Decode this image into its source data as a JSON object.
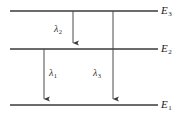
{
  "diagram": {
    "type": "energy-level-diagram",
    "title": "",
    "background_color": "#ffffff",
    "line_color": "#3a3a3a",
    "arrow_color": "#4a4a4a",
    "text_color": "#1a1a1a",
    "levels": [
      {
        "id": "E3",
        "symbol": "E",
        "subscript": "3",
        "y": 11,
        "x_start": 10,
        "x_end": 158,
        "label_x": 161,
        "label_y": 5
      },
      {
        "id": "E2",
        "symbol": "E",
        "subscript": "2",
        "y": 49,
        "x_start": 10,
        "x_end": 158,
        "label_x": 161,
        "label_y": 43
      },
      {
        "id": "E1",
        "symbol": "E",
        "subscript": "1",
        "y": 105,
        "x_start": 10,
        "x_end": 158,
        "label_x": 161,
        "label_y": 99
      }
    ],
    "transitions": [
      {
        "id": "lambda2",
        "symbol": "λ",
        "subscript": "2",
        "from_level": "E3",
        "to_level": "E2",
        "x": 73,
        "y_start": 11,
        "y_end": 49,
        "label_x": 54,
        "label_y": 24,
        "direction": "down"
      },
      {
        "id": "lambda1",
        "symbol": "λ",
        "subscript": "1",
        "from_level": "E2",
        "to_level": "E1",
        "x": 44,
        "y_start": 49,
        "y_end": 105,
        "label_x": 49,
        "label_y": 68,
        "direction": "down"
      },
      {
        "id": "lambda3",
        "symbol": "λ",
        "subscript": "3",
        "from_level": "E3",
        "to_level": "E1",
        "x": 113,
        "y_start": 11,
        "y_end": 105,
        "label_x": 93,
        "label_y": 68,
        "direction": "down"
      }
    ]
  }
}
